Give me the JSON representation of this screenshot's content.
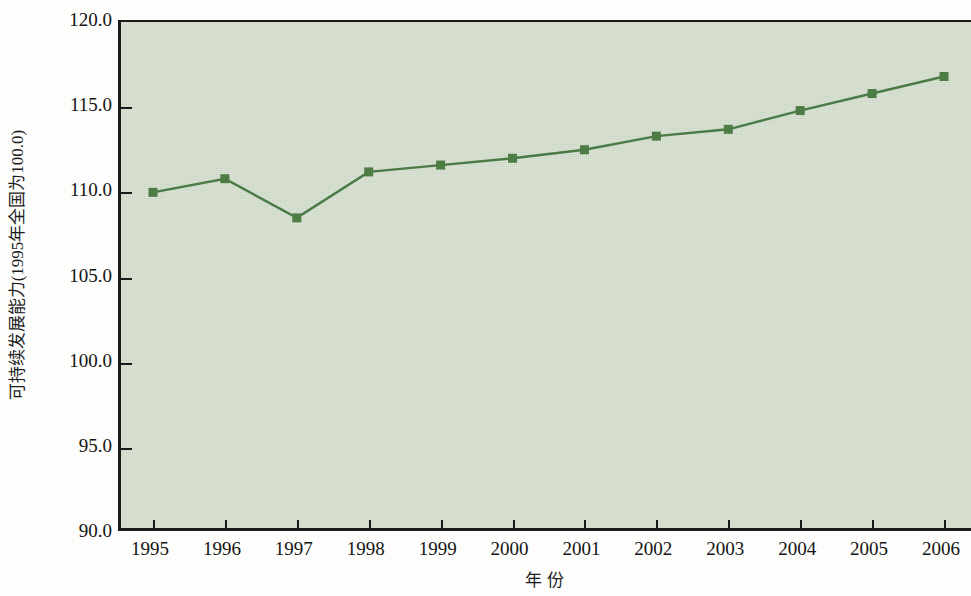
{
  "chart_data": {
    "type": "line",
    "title": "",
    "xlabel": "年  份",
    "ylabel": "可持续发展能力(1995年全国为100.0)",
    "categories": [
      "1995",
      "1996",
      "1997",
      "1998",
      "1999",
      "2000",
      "2001",
      "2002",
      "2003",
      "2004",
      "2005",
      "2006"
    ],
    "x": [
      1995,
      1996,
      1997,
      1998,
      1999,
      2000,
      2001,
      2002,
      2003,
      2004,
      2005,
      2006
    ],
    "series": [
      {
        "name": "可持续发展能力",
        "values": [
          110.0,
          110.8,
          108.5,
          111.2,
          111.6,
          112.0,
          112.5,
          113.3,
          113.7,
          114.8,
          115.8,
          116.8
        ]
      }
    ],
    "ylim": [
      90.0,
      120.0
    ],
    "ytick_labels": [
      "120.0",
      "115.0",
      "110.0",
      "105.0",
      "100.0",
      "95.0",
      "90.0"
    ],
    "yticks": [
      120.0,
      115.0,
      110.0,
      105.0,
      100.0,
      95.0,
      90.0
    ],
    "grid": false,
    "legend": "none",
    "colors": {
      "line": "#4a7a45",
      "marker": "#4d7c45",
      "plot_background": "#ccd7c5",
      "axis": "#1a1a1a",
      "text": "#141414",
      "page_background": "#fdfdfb"
    },
    "marker_style": "square",
    "line_width": 2.4,
    "marker_size": 9
  }
}
